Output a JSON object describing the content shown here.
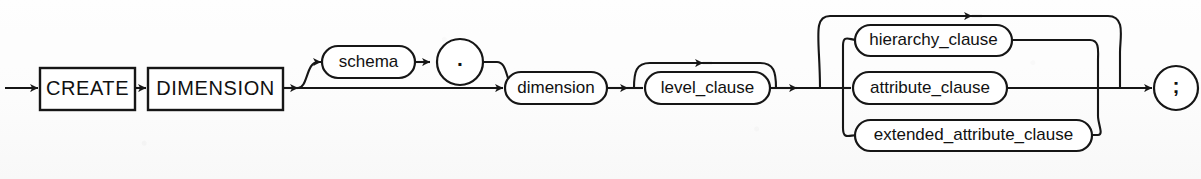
{
  "diagram": {
    "kind": "railroad-syntax-diagram",
    "statement": "CREATE DIMENSION",
    "terminator": ";",
    "colors": {
      "ink": "#161616",
      "paper": "#fdfdfd",
      "label": "#111111"
    },
    "keywords": [
      {
        "id": "create",
        "label": "CREATE"
      },
      {
        "id": "dimension_kw",
        "label": "DIMENSION"
      }
    ],
    "nonterminals": [
      {
        "id": "schema",
        "label": "schema",
        "optional": true
      },
      {
        "id": "dimension",
        "label": "dimension",
        "optional": false
      },
      {
        "id": "level_clause",
        "label": "level_clause",
        "repeatable": true
      },
      {
        "id": "hierarchy_clause",
        "label": "hierarchy_clause",
        "repeatable": true
      },
      {
        "id": "attribute_clause",
        "label": "attribute_clause",
        "repeatable": true
      },
      {
        "id": "extended_attribute_clause",
        "label": "extended_attribute_clause",
        "repeatable": true
      }
    ],
    "punctuation": [
      {
        "id": "dot",
        "label": "."
      },
      {
        "id": "semicolon",
        "label": ";"
      }
    ]
  }
}
